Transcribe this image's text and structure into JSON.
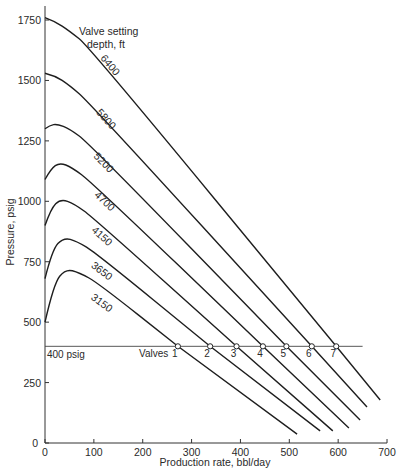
{
  "chart_data": {
    "type": "line",
    "title": "",
    "xlabel": "Production rate, bbl/day",
    "ylabel": "Pressure, psig",
    "xlim": [
      0,
      700
    ],
    "ylim": [
      0,
      1750
    ],
    "xticks": [
      0,
      100,
      200,
      300,
      400,
      500,
      600,
      700
    ],
    "yticks": [
      0,
      250,
      500,
      750,
      1000,
      1250,
      1500,
      1750
    ],
    "grid": false,
    "legend_title": "Valve setting depth, ft",
    "reference_line": {
      "label": "400 psig",
      "y": 400,
      "x_start": 0,
      "x_end": 650
    },
    "valves_label": "Valves",
    "valves": [
      {
        "label": "1",
        "x": 272,
        "y": 400
      },
      {
        "label": "2",
        "x": 338,
        "y": 400
      },
      {
        "label": "3",
        "x": 392,
        "y": 400
      },
      {
        "label": "4",
        "x": 446,
        "y": 400
      },
      {
        "label": "5",
        "x": 494,
        "y": 400
      },
      {
        "label": "6",
        "x": 546,
        "y": 400
      },
      {
        "label": "7",
        "x": 596,
        "y": 400
      }
    ],
    "series": [
      {
        "name": "6400",
        "points": [
          [
            0,
            1760
          ],
          [
            20,
            1745
          ],
          [
            50,
            1705
          ],
          [
            90,
            1640
          ],
          [
            596,
            400
          ],
          [
            686,
            178
          ]
        ],
        "label_at": [
          128,
          1555
        ]
      },
      {
        "name": "5800",
        "points": [
          [
            0,
            1530
          ],
          [
            20,
            1520
          ],
          [
            50,
            1480
          ],
          [
            90,
            1410
          ],
          [
            546,
            400
          ],
          [
            659,
            149
          ]
        ],
        "label_at": [
          120,
          1330
        ]
      },
      {
        "name": "5200",
        "points": [
          [
            0,
            1300
          ],
          [
            10,
            1315
          ],
          [
            25,
            1320
          ],
          [
            50,
            1300
          ],
          [
            90,
            1240
          ],
          [
            494,
            400
          ],
          [
            645,
            95
          ]
        ],
        "label_at": [
          115,
          1150
        ]
      },
      {
        "name": "4700",
        "points": [
          [
            0,
            1090
          ],
          [
            12,
            1135
          ],
          [
            30,
            1160
          ],
          [
            55,
            1140
          ],
          [
            95,
            1080
          ],
          [
            446,
            400
          ],
          [
            622,
            62
          ]
        ],
        "label_at": [
          117,
          990
        ]
      },
      {
        "name": "4150",
        "points": [
          [
            0,
            900
          ],
          [
            12,
            970
          ],
          [
            32,
            1010
          ],
          [
            60,
            990
          ],
          [
            100,
            930
          ],
          [
            392,
            400
          ],
          [
            589,
            50
          ]
        ],
        "label_at": [
          112,
          845
        ]
      },
      {
        "name": "3650",
        "points": [
          [
            0,
            680
          ],
          [
            15,
            800
          ],
          [
            38,
            850
          ],
          [
            65,
            835
          ],
          [
            105,
            785
          ],
          [
            338,
            400
          ],
          [
            563,
            50
          ]
        ],
        "label_at": [
          112,
          700
        ]
      },
      {
        "name": "3150",
        "points": [
          [
            0,
            500
          ],
          [
            18,
            660
          ],
          [
            42,
            720
          ],
          [
            70,
            705
          ],
          [
            110,
            660
          ],
          [
            272,
            400
          ],
          [
            516,
            37
          ]
        ],
        "label_at": [
          112,
          568
        ]
      }
    ]
  }
}
